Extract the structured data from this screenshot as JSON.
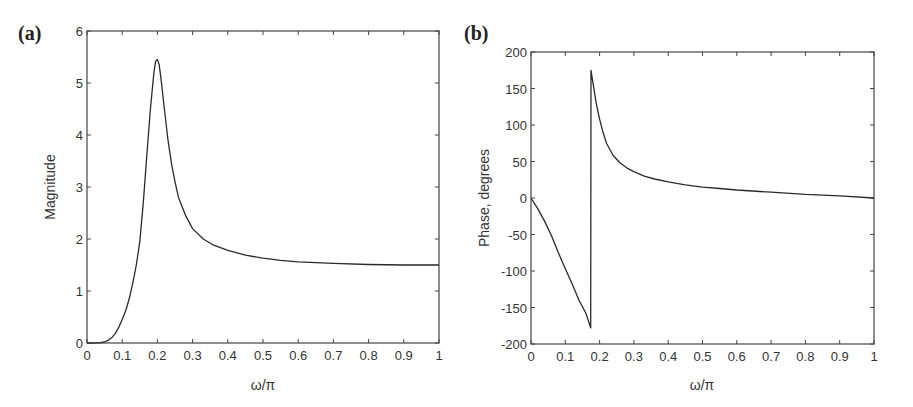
{
  "figure": {
    "panels": [
      {
        "id": "a",
        "label": "(a)"
      },
      {
        "id": "b",
        "label": "(b)"
      }
    ]
  },
  "chart_data": [
    {
      "type": "line",
      "panel_label": "(a)",
      "title": "",
      "xlabel": "ω/π",
      "ylabel": "Magnitude",
      "xlim": [
        0,
        1
      ],
      "ylim": [
        0,
        6
      ],
      "xticks": [
        0,
        0.1,
        0.2,
        0.3,
        0.4,
        0.5,
        0.6,
        0.7,
        0.8,
        0.9,
        1
      ],
      "xtick_labels": [
        "0",
        "0.1",
        "0.2",
        "0.3",
        "0.4",
        "0.5",
        "0.6",
        "0.7",
        "0.8",
        "0.9",
        "1"
      ],
      "yticks": [
        0,
        1,
        2,
        3,
        4,
        5,
        6
      ],
      "ytick_labels": [
        "0",
        "1",
        "2",
        "3",
        "4",
        "5",
        "6"
      ],
      "grid": false,
      "legend": null,
      "series": [
        {
          "name": "Magnitude",
          "x": [
            0,
            0.02,
            0.04,
            0.05,
            0.06,
            0.07,
            0.08,
            0.09,
            0.1,
            0.11,
            0.12,
            0.13,
            0.14,
            0.15,
            0.16,
            0.17,
            0.18,
            0.19,
            0.195,
            0.2,
            0.205,
            0.21,
            0.22,
            0.23,
            0.24,
            0.25,
            0.26,
            0.28,
            0.3,
            0.33,
            0.36,
            0.4,
            0.45,
            0.5,
            0.55,
            0.6,
            0.7,
            0.8,
            0.9,
            1.0
          ],
          "y": [
            0,
            0,
            0.01,
            0.02,
            0.05,
            0.1,
            0.18,
            0.3,
            0.45,
            0.62,
            0.85,
            1.15,
            1.5,
            1.95,
            2.7,
            3.6,
            4.5,
            5.2,
            5.42,
            5.45,
            5.35,
            5.1,
            4.5,
            3.9,
            3.45,
            3.1,
            2.8,
            2.45,
            2.2,
            2.0,
            1.88,
            1.78,
            1.69,
            1.63,
            1.59,
            1.56,
            1.53,
            1.51,
            1.5,
            1.5
          ]
        }
      ]
    },
    {
      "type": "line",
      "panel_label": "(b)",
      "title": "",
      "xlabel": "ω/π",
      "ylabel": "Phase, degrees",
      "xlim": [
        0,
        1
      ],
      "ylim": [
        -200,
        200
      ],
      "xticks": [
        0,
        0.1,
        0.2,
        0.3,
        0.4,
        0.5,
        0.6,
        0.7,
        0.8,
        0.9,
        1
      ],
      "xtick_labels": [
        "0",
        "0.1",
        "0.2",
        "0.3",
        "0.4",
        "0.5",
        "0.6",
        "0.7",
        "0.8",
        "0.9",
        "1"
      ],
      "yticks": [
        -200,
        -150,
        -100,
        -50,
        0,
        50,
        100,
        150,
        200
      ],
      "ytick_labels": [
        "-200",
        "-150",
        "-100",
        "-50",
        "0",
        "50",
        "100",
        "150",
        "200"
      ],
      "grid": false,
      "legend": null,
      "series": [
        {
          "name": "Phase",
          "x": [
            0,
            0.02,
            0.04,
            0.06,
            0.08,
            0.1,
            0.12,
            0.14,
            0.16,
            0.174,
            0.175,
            0.18,
            0.19,
            0.2,
            0.21,
            0.22,
            0.24,
            0.26,
            0.28,
            0.3,
            0.33,
            0.36,
            0.4,
            0.45,
            0.5,
            0.55,
            0.6,
            0.7,
            0.8,
            0.9,
            1.0
          ],
          "y": [
            0,
            -15,
            -32,
            -52,
            -75,
            -97,
            -118,
            -140,
            -158,
            -178,
            175,
            160,
            130,
            108,
            90,
            75,
            58,
            48,
            41,
            36,
            30,
            26,
            22,
            18,
            15,
            13,
            11,
            8,
            5,
            3,
            0
          ]
        }
      ]
    }
  ]
}
